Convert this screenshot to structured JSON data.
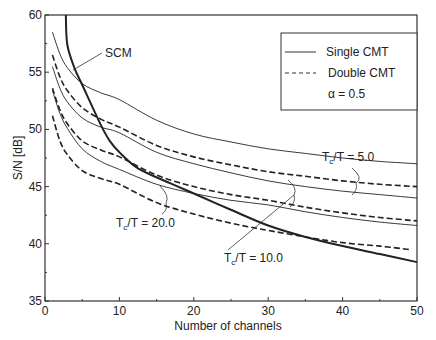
{
  "chart_data": {
    "type": "line",
    "title": "",
    "xlabel": "Number of channels",
    "ylabel": "S/N [dB]",
    "xlim": [
      0,
      50
    ],
    "ylim": [
      35,
      60
    ],
    "xticks": [
      0,
      10,
      20,
      30,
      40,
      50
    ],
    "yticks": [
      35,
      40,
      45,
      50,
      55,
      60
    ],
    "xminor": [
      5,
      15,
      25,
      35,
      45
    ],
    "yminor": [
      37.5,
      42.5,
      47.5,
      52.5,
      57.5
    ],
    "grid": false,
    "legend": {
      "placement": "top-right",
      "entries": [
        {
          "label": "Single CMT",
          "style": "solid"
        },
        {
          "label": "Double CMT",
          "style": "dashed"
        }
      ],
      "note": "α = 0.5"
    },
    "series": [
      {
        "name": "SCM",
        "style": "solid-bold",
        "x": [
          2.8,
          3.0,
          4.0,
          5.0,
          7.5,
          8.7,
          10,
          12.5,
          16.8,
          20,
          24.9,
          30,
          35,
          40,
          45,
          50
        ],
        "y": [
          60.0,
          57.4,
          55.3,
          53.9,
          50.4,
          49.0,
          48.0,
          46.6,
          45.3,
          44.4,
          43.0,
          41.6,
          40.6,
          39.8,
          39.1,
          38.4
        ]
      },
      {
        "name": "Single CMT, Tc/T = 5.0",
        "style": "solid",
        "x": [
          1,
          2,
          3,
          5,
          7.5,
          10,
          15,
          20,
          25,
          30,
          35,
          40,
          45,
          50
        ],
        "y": [
          58.5,
          56.6,
          55.4,
          54.0,
          53.2,
          52.6,
          50.8,
          49.6,
          48.9,
          48.3,
          47.9,
          47.5,
          47.2,
          47.0
        ]
      },
      {
        "name": "Double CMT, Tc/T = 5.0",
        "style": "dashed",
        "x": [
          1,
          2,
          3,
          5,
          7.5,
          10,
          15,
          20,
          25,
          30,
          35,
          40,
          45,
          50
        ],
        "y": [
          56.5,
          54.6,
          53.4,
          51.9,
          50.9,
          50.2,
          48.6,
          47.6,
          46.9,
          46.3,
          45.9,
          45.5,
          45.2,
          45.0
        ]
      },
      {
        "name": "Single CMT, Tc/T = 10.0",
        "style": "solid",
        "x": [
          1,
          2,
          3,
          5,
          7.5,
          10,
          15,
          20,
          25,
          30,
          35,
          40,
          45,
          50
        ],
        "y": [
          55.5,
          53.6,
          52.4,
          51.0,
          50.2,
          49.7,
          48.0,
          47.0,
          46.2,
          45.5,
          45.0,
          44.6,
          44.3,
          44.0
        ]
      },
      {
        "name": "Double CMT, Tc/T = 10.0",
        "style": "dashed",
        "x": [
          1,
          2,
          3,
          5,
          7.5,
          10,
          15,
          20,
          25,
          30,
          35,
          40,
          45,
          50
        ],
        "y": [
          53.6,
          51.7,
          50.5,
          49.0,
          48.2,
          47.6,
          46.0,
          45.0,
          44.3,
          43.8,
          43.2,
          42.7,
          42.3,
          42.0
        ]
      },
      {
        "name": "Single CMT, Tc/T = 20.0",
        "style": "solid",
        "x": [
          1,
          2,
          3,
          5,
          7.5,
          10,
          15,
          20,
          25,
          30,
          35,
          40,
          45,
          50
        ],
        "y": [
          53.4,
          51.4,
          50.1,
          48.3,
          47.2,
          46.5,
          45.2,
          44.4,
          43.8,
          43.4,
          42.8,
          42.3,
          41.9,
          41.6
        ]
      },
      {
        "name": "Double CMT, Tc/T = 20.0",
        "style": "dashed",
        "x": [
          1,
          2,
          3,
          5,
          7.5,
          10,
          15,
          20,
          25,
          28.9,
          35,
          40,
          45,
          49
        ],
        "y": [
          51.2,
          49.0,
          47.8,
          46.4,
          45.7,
          45.2,
          43.6,
          42.6,
          41.8,
          41.3,
          40.6,
          40.1,
          39.8,
          39.5
        ]
      }
    ],
    "annotations": [
      {
        "text_main": "SCM",
        "target_series": "SCM"
      },
      {
        "text_main": "T",
        "text_sub": "c",
        "text_rest": "/T = 5.0"
      },
      {
        "text_main": "T",
        "text_sub": "c",
        "text_rest": "/T = 10.0"
      },
      {
        "text_main": "T",
        "text_sub": "c",
        "text_rest": "/T = 20.0"
      }
    ]
  }
}
